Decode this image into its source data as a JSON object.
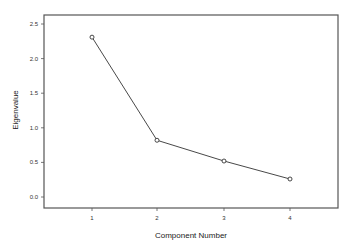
{
  "chart_data": {
    "type": "line",
    "title": "",
    "xlabel": "Component Number",
    "ylabel": "Eigenvalue",
    "categories": [
      "1",
      "2",
      "3",
      "4"
    ],
    "x": [
      1,
      2,
      3,
      4
    ],
    "values": [
      2.31,
      0.82,
      0.52,
      0.26
    ],
    "series": [
      {
        "name": "Eigenvalue",
        "values": [
          2.31,
          0.82,
          0.52,
          0.26
        ]
      }
    ],
    "ylim": [
      0.0,
      2.5
    ],
    "yticks": [
      "0.0",
      "0.5",
      "1.0",
      "1.5",
      "2.0",
      "2.5"
    ],
    "xticks": [
      "1",
      "2",
      "3",
      "4"
    ],
    "grid": false,
    "legend": "none",
    "marker": "open-circle",
    "line_color": "#333333"
  }
}
